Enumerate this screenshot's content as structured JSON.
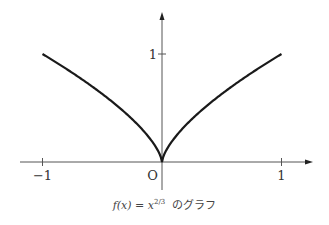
{
  "chart_data": {
    "type": "line",
    "title": "",
    "function": "f(x) = x^(2/3)",
    "series": [
      {
        "name": "f(x) = x^(2/3)",
        "x_range": [
          -1,
          1
        ],
        "samples": 201
      }
    ],
    "xlim": [
      -1.33,
      1.1
    ],
    "ylim": [
      -0.25,
      1.4
    ],
    "x_ticks": [
      {
        "value": -1,
        "label": "−1"
      },
      {
        "value": 1,
        "label": "1"
      }
    ],
    "y_ticks": [
      {
        "value": 1,
        "label": "1"
      }
    ],
    "origin_label": "O",
    "grid": false,
    "legend": "none",
    "colors": {
      "curve": "#1a1a1a",
      "axis": "#555555"
    }
  },
  "caption": {
    "lhs": "f(x) = x",
    "exponent": "2/3",
    "suffix": "のグラフ"
  }
}
